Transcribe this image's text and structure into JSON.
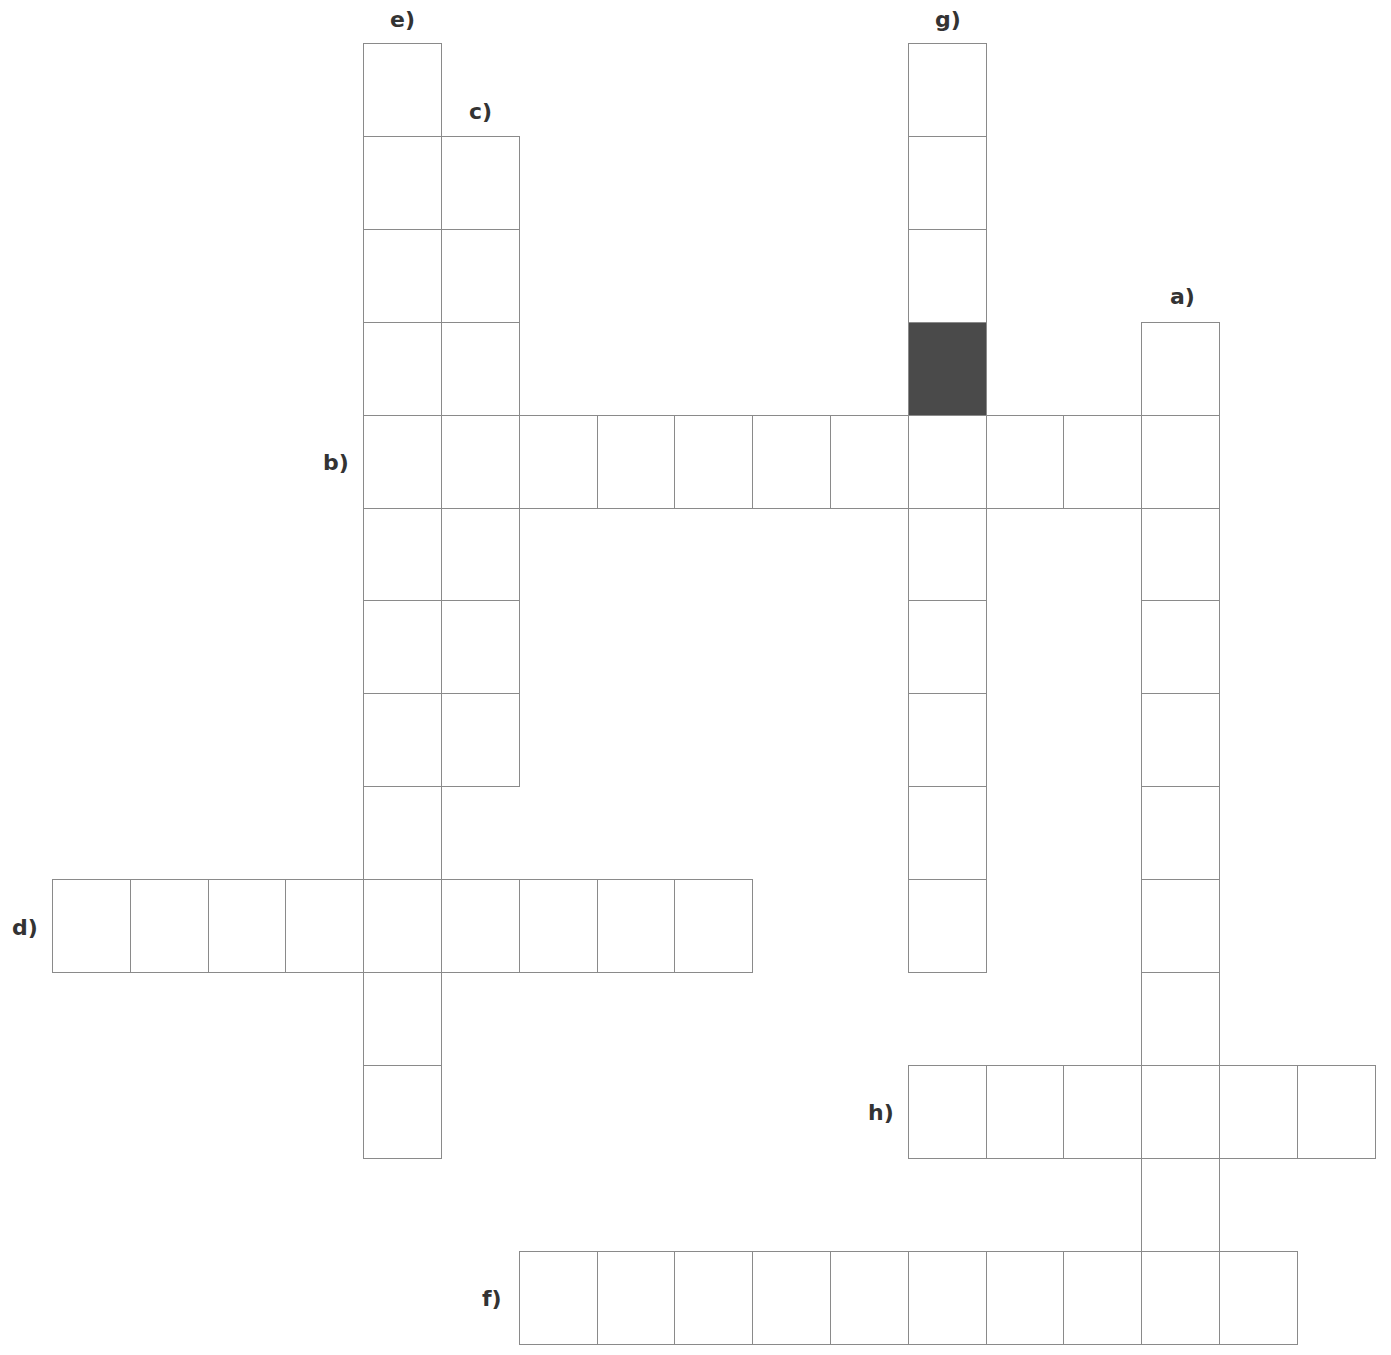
{
  "colors": {
    "line": "#8a8a8a",
    "blocked_cell": "#4a4a4a",
    "background": "#ffffff",
    "label": "#333333"
  },
  "grid": {
    "origin_x": 52,
    "origin_y": 43,
    "cell_width": 77.8,
    "cell_height": 92.9,
    "cols": 17,
    "rows": 14
  },
  "entries": [
    {
      "id": "a",
      "label": "a)",
      "direction": "down",
      "col": 14,
      "row": 3,
      "length": 11,
      "label_pos": [
        1170,
        286
      ]
    },
    {
      "id": "b",
      "label": "b)",
      "direction": "across",
      "col": 4,
      "row": 4,
      "length": 11,
      "label_pos": [
        323,
        452
      ]
    },
    {
      "id": "c",
      "label": "c)",
      "direction": "down",
      "col": 5,
      "row": 1,
      "length": 7,
      "label_pos": [
        469,
        101
      ]
    },
    {
      "id": "d",
      "label": "d)",
      "direction": "across",
      "col": 0,
      "row": 9,
      "length": 9,
      "label_pos": [
        12,
        917
      ]
    },
    {
      "id": "e",
      "label": "e)",
      "direction": "down",
      "col": 4,
      "row": 0,
      "length": 12,
      "label_pos": [
        390,
        9
      ]
    },
    {
      "id": "f",
      "label": "f)",
      "direction": "across",
      "col": 6,
      "row": 13,
      "length": 10,
      "label_pos": [
        482,
        1288
      ]
    },
    {
      "id": "g",
      "label": "g)",
      "direction": "down",
      "col": 11,
      "row": 0,
      "length": 10,
      "label_pos": [
        935,
        9
      ]
    },
    {
      "id": "h",
      "label": "h)",
      "direction": "across",
      "col": 11,
      "row": 11,
      "length": 6,
      "label_pos": [
        868,
        1102
      ]
    }
  ],
  "blocked_cells": [
    {
      "col": 11,
      "row": 3
    }
  ]
}
